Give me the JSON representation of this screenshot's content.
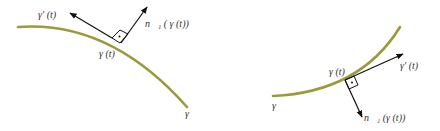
{
  "colors": {
    "curve": "#9a9a3a",
    "arrow": "#111111",
    "label": "#333333"
  },
  "left_figure": {
    "tangent_label": "γ′ (t)",
    "normal_label": "n⃗₁ ( γ (t))",
    "point_label": "γ (t)",
    "curve_label": "γ"
  },
  "right_figure": {
    "tangent_label": "γ′ (t)",
    "normal_label": "n⃗₁ (γ (t))",
    "point_label": "γ (t)",
    "curve_label": "γ"
  }
}
